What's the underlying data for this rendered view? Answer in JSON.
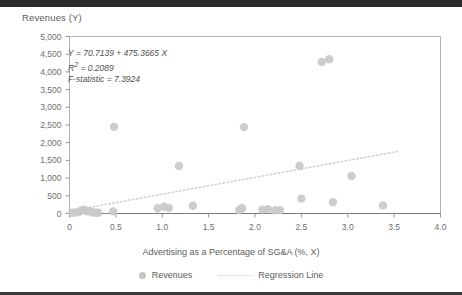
{
  "figure": {
    "title": "Revenues (Y)",
    "xaxis_title": "Advertising as a Percentage of SG&A  (%, X)",
    "annotation": {
      "equation": "Y = 70.7139 + 475.3665 X",
      "r_squared_label": "R",
      "r_squared_sup": "2",
      "r_squared_value": " = 0.2089",
      "f_statistic": "F-statistic = 7.3924"
    },
    "legend": {
      "series_label": "Revenues",
      "line_label": "Regression Line"
    },
    "colors": {
      "marker": "#c9c9c9",
      "regression_line": "#d2d2d2",
      "axis": "#8a8a8a",
      "frame": "#a9a9a9",
      "text": "#5d5d5d",
      "topbar": "#2b2b2b"
    }
  },
  "chart_data": {
    "type": "scatter",
    "title": "Revenues (Y)",
    "xlabel": "Advertising as a Percentage of SG&A  (%, X)",
    "ylabel": "Revenues (Y)",
    "xlim": [
      0,
      4.0
    ],
    "ylim": [
      0,
      5000
    ],
    "xticks": [
      0,
      0.5,
      1.0,
      1.5,
      2.0,
      2.5,
      3.0,
      3.5,
      4.0
    ],
    "xticklabels": [
      "0",
      "0.5",
      "1.0",
      "1.5",
      "2.0",
      "2.5",
      "3.0",
      "3.5",
      "4.0"
    ],
    "yticks": [
      0,
      500,
      1000,
      1500,
      2000,
      2500,
      3000,
      3500,
      4000,
      4500,
      5000
    ],
    "yticklabels": [
      "0",
      "500",
      "1,000",
      "1,500",
      "2,000",
      "2,500",
      "3,000",
      "3,500",
      "4,000",
      "4,500",
      "5,000"
    ],
    "grid": false,
    "legend_position": "bottom-center",
    "series": [
      {
        "name": "Revenues",
        "type": "scatter",
        "marker_color": "#c9c9c9",
        "points": [
          {
            "x": 0.03,
            "y": 20
          },
          {
            "x": 0.07,
            "y": 30
          },
          {
            "x": 0.1,
            "y": 40
          },
          {
            "x": 0.13,
            "y": 90
          },
          {
            "x": 0.16,
            "y": 110
          },
          {
            "x": 0.19,
            "y": 60
          },
          {
            "x": 0.22,
            "y": 70
          },
          {
            "x": 0.25,
            "y": 30
          },
          {
            "x": 0.28,
            "y": 25
          },
          {
            "x": 0.31,
            "y": 20
          },
          {
            "x": 0.47,
            "y": 60
          },
          {
            "x": 0.48,
            "y": 2450
          },
          {
            "x": 0.95,
            "y": 150
          },
          {
            "x": 1.02,
            "y": 190
          },
          {
            "x": 1.07,
            "y": 160
          },
          {
            "x": 1.18,
            "y": 1340
          },
          {
            "x": 1.33,
            "y": 220
          },
          {
            "x": 1.83,
            "y": 100
          },
          {
            "x": 1.86,
            "y": 150
          },
          {
            "x": 1.88,
            "y": 2440
          },
          {
            "x": 2.08,
            "y": 110
          },
          {
            "x": 2.14,
            "y": 120
          },
          {
            "x": 2.22,
            "y": 90
          },
          {
            "x": 2.27,
            "y": 95
          },
          {
            "x": 2.48,
            "y": 1350
          },
          {
            "x": 2.5,
            "y": 420
          },
          {
            "x": 2.72,
            "y": 4280
          },
          {
            "x": 2.8,
            "y": 4360
          },
          {
            "x": 2.84,
            "y": 320
          },
          {
            "x": 3.04,
            "y": 1060
          },
          {
            "x": 3.38,
            "y": 230
          }
        ]
      },
      {
        "name": "Regression Line",
        "type": "line",
        "style": "dotted",
        "color": "#d2d2d2",
        "intercept": 70.7139,
        "slope": 475.3665,
        "x_start": 0.0,
        "x_end": 3.55
      }
    ],
    "annotations": [
      "Y = 70.7139 + 475.3665 X",
      "R2 = 0.2089",
      "F-statistic = 7.3924"
    ],
    "statistics": {
      "intercept": 70.7139,
      "slope": 475.3665,
      "r_squared": 0.2089,
      "f_statistic": 7.3924
    }
  }
}
